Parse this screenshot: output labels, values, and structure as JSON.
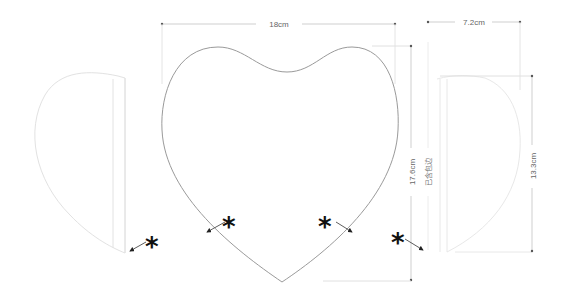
{
  "diagram": {
    "dimensions": {
      "front_width": "18cm",
      "front_height": "17.6cm",
      "side_width": "7.2cm",
      "side_height": "13.3cm",
      "binding_note": "已含包边"
    },
    "markers": {
      "asterisk": "*"
    },
    "colors": {
      "outline": "#9a9a9a",
      "faint_outline": "#dcdcdc",
      "dimension_line": "#cfcfcf",
      "label": "#666666",
      "marker": "#111111"
    }
  }
}
